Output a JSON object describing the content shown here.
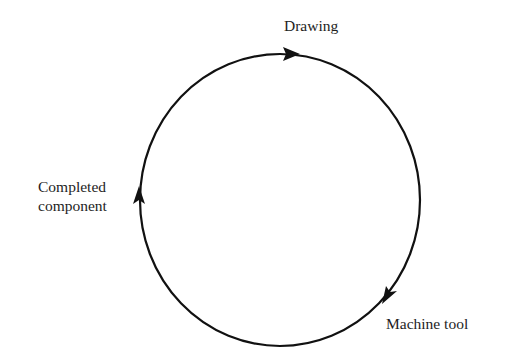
{
  "diagram": {
    "type": "cycle",
    "direction": "clockwise",
    "nodes": [
      {
        "id": "drawing",
        "label": "Drawing"
      },
      {
        "id": "machine_tool",
        "label": "Machine tool"
      },
      {
        "id": "completed_component",
        "label_line1": "Completed",
        "label_line2": "component"
      }
    ],
    "edges": [
      {
        "from": "completed_component",
        "to": "drawing"
      },
      {
        "from": "drawing",
        "to": "machine_tool"
      },
      {
        "from": "machine_tool",
        "to": "completed_component"
      }
    ],
    "colors": {
      "stroke": "#111111",
      "background": "#ffffff",
      "text": "#1e1e1e"
    }
  }
}
